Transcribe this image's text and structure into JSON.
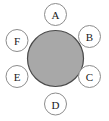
{
  "diagram": {
    "type": "hub-and-spoke",
    "title": "",
    "background_color": "#ffffff",
    "hub": {
      "label": "",
      "fill_color": "#a8a8a8",
      "stroke_color": "#4a4a4a",
      "center_x": 55.5,
      "center_y": 58.5,
      "radius": 28
    },
    "satellite_style": {
      "fill_color": "#ffffff",
      "stroke_color": "#8c8c8c",
      "text_color": "#1a1a1a",
      "radius": 11
    },
    "satellites": [
      {
        "label": "A",
        "angle_deg": 90,
        "center_x": 55.5,
        "center_y": 14.5
      },
      {
        "label": "B",
        "angle_deg": 30,
        "center_x": 89.5,
        "center_y": 36.5
      },
      {
        "label": "C",
        "angle_deg": 330,
        "center_x": 89.5,
        "center_y": 76.5
      },
      {
        "label": "D",
        "angle_deg": 270,
        "center_x": 55.5,
        "center_y": 104.0
      },
      {
        "label": "E",
        "angle_deg": 210,
        "center_x": 17.0,
        "center_y": 76.5
      },
      {
        "label": "F",
        "angle_deg": 150,
        "center_x": 17.0,
        "center_y": 40.5
      }
    ]
  }
}
